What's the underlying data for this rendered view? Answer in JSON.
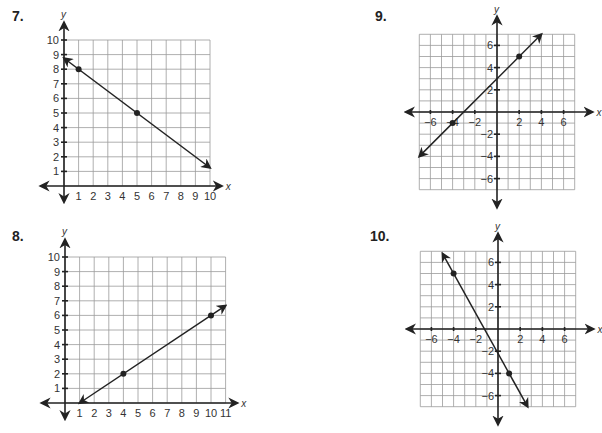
{
  "problems": [
    {
      "number": "7.",
      "xlabel": "x",
      "ylabel": "y"
    },
    {
      "number": "8.",
      "xlabel": "x",
      "ylabel": "y"
    },
    {
      "number": "9.",
      "xlabel": "x",
      "ylabel": "y"
    },
    {
      "number": "10.",
      "xlabel": "x",
      "ylabel": "y"
    }
  ],
  "chart_data": [
    {
      "type": "line",
      "title": "7.",
      "xlabel": "x",
      "ylabel": "y",
      "xlim": [
        0,
        10
      ],
      "ylim": [
        0,
        10
      ],
      "x_ticks": [
        1,
        2,
        3,
        4,
        5,
        6,
        7,
        8,
        9,
        10
      ],
      "y_ticks": [
        1,
        2,
        3,
        4,
        5,
        6,
        7,
        8,
        9,
        10
      ],
      "grid": true,
      "points": [
        [
          1,
          8
        ],
        [
          5,
          5
        ]
      ],
      "line": {
        "slope": -0.75,
        "intercept": 8.75,
        "from": [
          0,
          8.75
        ],
        "to": [
          10,
          1.25
        ]
      }
    },
    {
      "type": "line",
      "title": "8.",
      "xlabel": "x",
      "ylabel": "y",
      "xlim": [
        0,
        11
      ],
      "ylim": [
        0,
        10
      ],
      "x_ticks": [
        1,
        2,
        3,
        4,
        5,
        6,
        7,
        8,
        9,
        10,
        11
      ],
      "y_ticks": [
        1,
        2,
        3,
        4,
        5,
        6,
        7,
        8,
        9,
        10
      ],
      "grid": true,
      "points": [
        [
          4,
          2
        ],
        [
          10,
          6
        ]
      ],
      "line": {
        "slope": 0.6667,
        "intercept": -0.6667,
        "from": [
          1,
          0
        ],
        "to": [
          11,
          6.67
        ]
      }
    },
    {
      "type": "line",
      "title": "9.",
      "xlabel": "x",
      "ylabel": "y",
      "xlim": [
        -7,
        7
      ],
      "ylim": [
        -7,
        7
      ],
      "x_ticks": [
        -6,
        -4,
        -2,
        2,
        4,
        6
      ],
      "y_ticks": [
        -6,
        -4,
        -2,
        2,
        4,
        6
      ],
      "grid": true,
      "points": [
        [
          -4,
          -1
        ],
        [
          2,
          5
        ]
      ],
      "line": {
        "slope": 1,
        "intercept": 3,
        "from": [
          -7,
          -4
        ],
        "to": [
          4,
          7
        ]
      }
    },
    {
      "type": "line",
      "title": "10.",
      "xlabel": "x",
      "ylabel": "y",
      "xlim": [
        -7,
        7
      ],
      "ylim": [
        -7,
        7
      ],
      "x_ticks": [
        -6,
        -4,
        -2,
        2,
        4,
        6
      ],
      "y_ticks": [
        -6,
        -4,
        -2,
        2,
        4,
        6
      ],
      "grid": true,
      "points": [
        [
          -4,
          5
        ],
        [
          1,
          -4
        ]
      ],
      "line": {
        "slope": -1.8,
        "intercept": -2.2,
        "from": [
          -5,
          6.8
        ],
        "to": [
          2.67,
          -7
        ]
      }
    }
  ]
}
